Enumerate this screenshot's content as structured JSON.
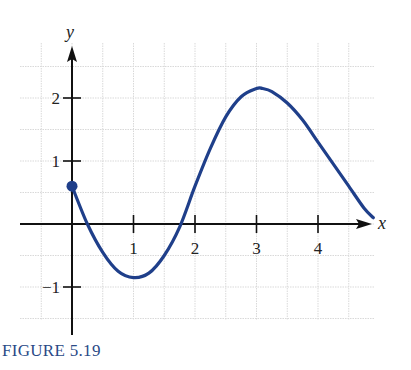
{
  "caption": "FIGURE 5.19",
  "colors": {
    "curve": "#1f3f8a",
    "axis": "#111111",
    "grid": "#d9d9d9",
    "caption": "#2a4a86"
  },
  "chart_data": {
    "type": "line",
    "title": "",
    "caption": "FIGURE 5.19",
    "xlabel": "x",
    "ylabel": "y",
    "xlim": [
      -0.85,
      4.95
    ],
    "ylim": [
      -1.5,
      2.75
    ],
    "x_ticks": [
      1,
      2,
      3,
      4
    ],
    "y_ticks": [
      -1,
      1,
      2
    ],
    "x_tick_labels": [
      "1",
      "2",
      "3",
      "4"
    ],
    "y_tick_labels": [
      "−1",
      "1",
      "2"
    ],
    "grid": true,
    "grid_spacing": 0.5,
    "start_point": {
      "x": 0,
      "y": 0.6,
      "marker": "filled-circle"
    },
    "series": [
      {
        "name": "f(x)",
        "x": [
          0,
          0.25,
          0.5,
          0.75,
          1.0,
          1.25,
          1.5,
          1.75,
          2.0,
          2.25,
          2.5,
          2.75,
          3.0,
          3.1,
          3.25,
          3.5,
          3.75,
          4.0,
          4.25,
          4.5,
          4.75,
          4.9
        ],
        "y": [
          0.6,
          0.0,
          -0.45,
          -0.75,
          -0.85,
          -0.78,
          -0.5,
          -0.05,
          0.6,
          1.2,
          1.7,
          2.02,
          2.15,
          2.15,
          2.1,
          1.92,
          1.65,
          1.3,
          0.95,
          0.6,
          0.25,
          0.1
        ]
      }
    ]
  }
}
